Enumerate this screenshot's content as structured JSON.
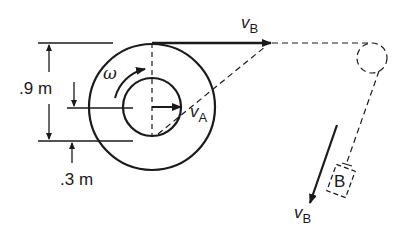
{
  "diagram": {
    "type": "pulley-spool kinematics",
    "labels": {
      "outer_dim": ".9 m",
      "inner_dim": ".3 m",
      "omega": "ω",
      "vA_main": "v",
      "vA_sub": "A",
      "vB_top_main": "v",
      "vB_top_sub": "B",
      "vB_bottom_main": "v",
      "vB_bottom_sub": "B",
      "block": "B"
    },
    "colors": {
      "stroke": "#1a1a1a",
      "background": "#ffffff"
    }
  }
}
